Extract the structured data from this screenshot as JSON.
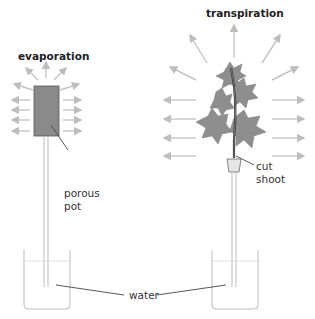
{
  "diagram": {
    "left_experiment": {
      "title": "evaporation",
      "labels": {
        "pot": [
          "porous",
          "pot"
        ]
      }
    },
    "right_experiment": {
      "title": "transpiration",
      "labels": {
        "shoot": [
          "cut",
          "shoot"
        ]
      }
    },
    "shared_label": "water",
    "colors": {
      "arrow": "#bdbdbd",
      "pot_fill": "#8a8a8a",
      "leaf_fill": "#8c8c8c",
      "line": "#444444",
      "beaker": "#bbbbbb"
    }
  }
}
